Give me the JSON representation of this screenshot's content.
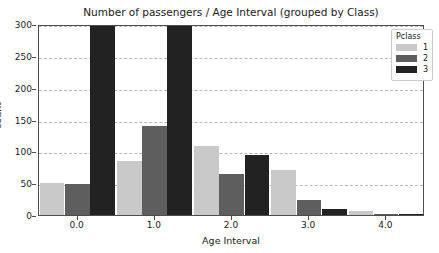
{
  "chart_data": {
    "type": "bar",
    "title": "Number of passengers / Age Interval (grouped by Class)",
    "xlabel": "Age Interval",
    "ylabel": "count",
    "categories": [
      "0.0",
      "1.0",
      "2.0",
      "3.0",
      "4.0"
    ],
    "series": [
      {
        "name": "1",
        "color": "#c9c9c9",
        "values": [
          50,
          85,
          108,
          70,
          7
        ]
      },
      {
        "name": "2",
        "color": "#5e5e5e",
        "values": [
          48,
          140,
          65,
          23,
          1
        ]
      },
      {
        "name": "3",
        "color": "#222222",
        "values": [
          300,
          300,
          95,
          10,
          2
        ]
      }
    ],
    "ylim": [
      0,
      300
    ],
    "yticks": [
      0,
      50,
      100,
      150,
      200,
      250,
      300
    ],
    "ytick_labels": [
      "0",
      "50",
      "100",
      "150",
      "200",
      "250",
      "300"
    ],
    "xtick_labels": [
      "0.0",
      "1.0",
      "2.0",
      "3.0",
      "4.0"
    ],
    "grid": true,
    "legend_position": "upper right",
    "legend_title": "Pclass",
    "note": "Class 3 bars at Age Interval 0.0 and 1.0 are clipped at the top of the axis (>= 300)"
  },
  "legend": {
    "title": "Pclass",
    "entries": [
      {
        "label": "1",
        "color": "#c9c9c9"
      },
      {
        "label": "2",
        "color": "#5e5e5e"
      },
      {
        "label": "3",
        "color": "#222222"
      }
    ]
  }
}
